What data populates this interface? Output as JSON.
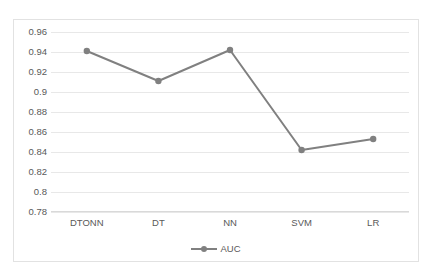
{
  "chart_data": {
    "type": "line",
    "title": "",
    "xlabel": "",
    "ylabel": "",
    "categories": [
      "DTONN",
      "DT",
      "NN",
      "SVM",
      "LR"
    ],
    "series": [
      {
        "name": "AUC",
        "values": [
          0.941,
          0.911,
          0.942,
          0.842,
          0.853
        ]
      }
    ],
    "ylim": [
      0.78,
      0.96
    ],
    "ytick_step": 0.02,
    "yticks": [
      "0.96",
      "0.94",
      "0.92",
      "0.9",
      "0.88",
      "0.86",
      "0.84",
      "0.82",
      "0.8",
      "0.78"
    ],
    "ytick_values": [
      0.96,
      0.94,
      0.92,
      0.9,
      0.88,
      0.86,
      0.84,
      0.82,
      0.8,
      0.78
    ],
    "grid": "horizontal",
    "legend_position": "bottom",
    "colors": {
      "series_auc": "#808080",
      "gridline": "#e8e8e8",
      "axis": "#d9d9d9",
      "border": "#e2e2e2",
      "tick_text": "#595959"
    }
  },
  "legend": {
    "items": [
      {
        "label": "AUC",
        "marker": "circle-marker",
        "color": "#808080"
      }
    ]
  }
}
